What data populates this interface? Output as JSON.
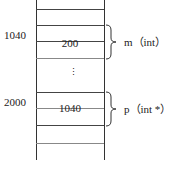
{
  "diagram": {
    "type": "memory-layout",
    "addresses": [
      {
        "label": "1040",
        "row": "m"
      },
      {
        "label": "2000",
        "row": "p"
      }
    ],
    "cells": [
      {
        "name": "m",
        "value": "200",
        "annotation": "m（int）"
      },
      {
        "name": "p",
        "value": "1040",
        "annotation": "p（int *）"
      }
    ],
    "ellipsis": "⋮"
  }
}
